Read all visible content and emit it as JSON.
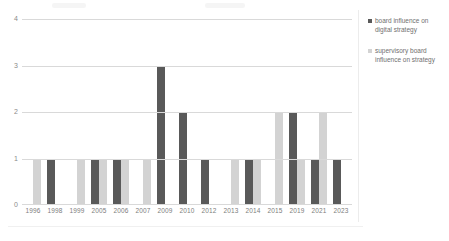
{
  "chart_data": {
    "type": "bar",
    "title": "",
    "xlabel": "",
    "ylabel": "",
    "ylim": [
      0,
      4
    ],
    "yticks": [
      "0",
      "1",
      "2",
      "3",
      "4"
    ],
    "grid": true,
    "legend_position": "right",
    "categories": [
      "1996",
      "1998",
      "1999",
      "2005",
      "2006",
      "2007",
      "2009",
      "2010",
      "2012",
      "2013",
      "2014",
      "2015",
      "2019",
      "2021",
      "2023"
    ],
    "series": [
      {
        "name": "board influence on digital strategy",
        "color": "#595959",
        "values": [
          0,
          1,
          0,
          1,
          1,
          0,
          3,
          2,
          1,
          0,
          1,
          0,
          2,
          1,
          1
        ]
      },
      {
        "name": "supervisory board influence on strategy",
        "color": "#d3d3d3",
        "values": [
          1,
          0,
          1,
          1,
          1,
          1,
          0,
          0,
          0,
          1,
          1,
          2,
          1,
          2,
          0
        ]
      }
    ]
  },
  "legend": {
    "entries": [
      {
        "label": "board influence on digital strategy"
      },
      {
        "label": "supervisory board influence on strategy"
      }
    ]
  }
}
